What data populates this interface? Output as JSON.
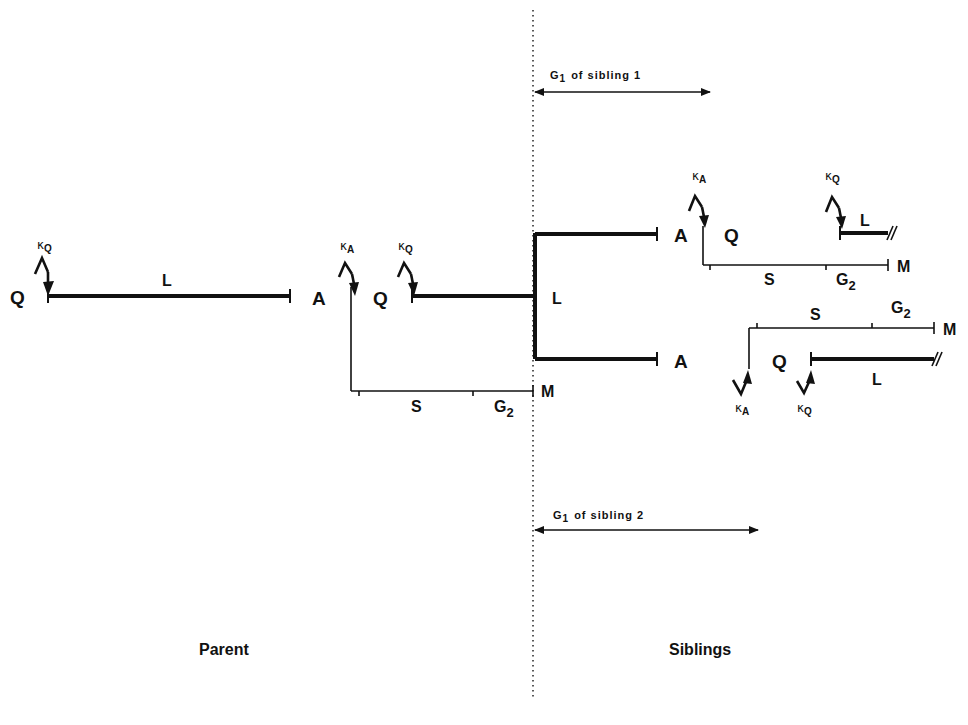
{
  "diagram": {
    "title": "",
    "divider": {
      "x": 533,
      "y1": 10,
      "y2": 700
    },
    "sections": {
      "parent_label": "Parent",
      "siblings_label": "Siblings"
    },
    "parent": {
      "q_label": "Q",
      "l_label": "L",
      "a_label": "A",
      "kappa_q": {
        "greek": "κ",
        "sub": "Q"
      },
      "second_kappa_a": {
        "greek": "κ",
        "sub": "A"
      },
      "second_kappa_q": {
        "greek": "κ",
        "sub": "Q"
      },
      "second_q_label": "Q",
      "branch_l_label": "L",
      "phase_s": "S",
      "phase_g2": {
        "main": "G",
        "sub": "2"
      },
      "m_label": "M"
    },
    "sibling1": {
      "a_label": "A",
      "q_label": "Q",
      "l_label": "L",
      "kappa_a": {
        "greek": "κ",
        "sub": "A"
      },
      "kappa_q": {
        "greek": "κ",
        "sub": "Q"
      },
      "phase_s": "S",
      "phase_g2": {
        "main": "G",
        "sub": "2"
      },
      "m_label": "M",
      "g1_annotation": {
        "main": "G",
        "sub": "1",
        "rest": "of sibling  1"
      }
    },
    "sibling2": {
      "a_label": "A",
      "q_label": "Q",
      "l_label": "L",
      "kappa_a": {
        "greek": "κ",
        "sub": "A"
      },
      "kappa_q": {
        "greek": "κ",
        "sub": "Q"
      },
      "phase_s": "S",
      "phase_g2": {
        "main": "G",
        "sub": "2"
      },
      "m_label": "M",
      "g1_annotation": {
        "main": "G",
        "sub": "1",
        "rest": "of sibling  2"
      }
    }
  }
}
